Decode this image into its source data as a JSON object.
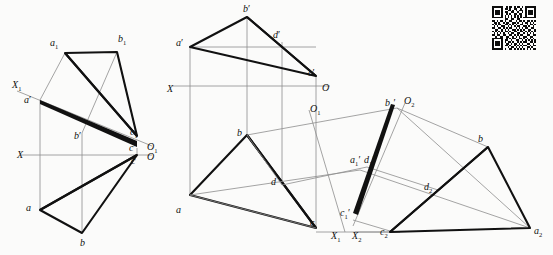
{
  "document": {
    "kind": "descriptive-geometry-projection-drawing",
    "figure_count": 3,
    "background_color": "#fbfbfa",
    "line_color": "#1a1a1a",
    "thin_line_color": "#8d8d8d"
  },
  "figures": [
    {
      "id": "figure-left",
      "name": "left-projection",
      "axes": [
        {
          "name": "x-axis-primary",
          "label": "X",
          "origin_label": "O"
        },
        {
          "name": "x1-axis-auxiliary",
          "label": "X",
          "sub": "1",
          "origin_label": "O",
          "origin_sub": "1"
        }
      ],
      "labels": [
        {
          "name": "vertex-a1",
          "base": "a",
          "sub": "1",
          "prime": "",
          "x": 50,
          "y": 38
        },
        {
          "name": "vertex-b1",
          "base": "b",
          "sub": "1",
          "prime": "",
          "x": 118,
          "y": 34
        },
        {
          "name": "axis-x1",
          "base": "X",
          "sub": "1",
          "prime": "",
          "x": 12,
          "y": 80
        },
        {
          "name": "vertex-a-prime",
          "base": "a",
          "sub": "",
          "prime": "′",
          "x": 24,
          "y": 95
        },
        {
          "name": "vertex-b-prime",
          "base": "b",
          "sub": "",
          "prime": "′",
          "x": 74,
          "y": 131
        },
        {
          "name": "vertex-c1",
          "base": "c",
          "sub": "1",
          "prime": "",
          "x": 130,
          "y": 127
        },
        {
          "name": "vertex-c-prime",
          "base": "c",
          "sub": "",
          "prime": "′",
          "x": 129,
          "y": 143
        },
        {
          "name": "origin-o1",
          "base": "O",
          "sub": "1",
          "prime": "",
          "x": 147,
          "y": 142
        },
        {
          "name": "axis-x",
          "base": "X",
          "sub": "",
          "prime": "",
          "x": 17,
          "y": 150
        },
        {
          "name": "vertex-c",
          "base": "c",
          "sub": "",
          "prime": "",
          "x": 131,
          "y": 156
        },
        {
          "name": "origin-o",
          "base": "O",
          "sub": "",
          "prime": "",
          "x": 147,
          "y": 152
        },
        {
          "name": "vertex-a",
          "base": "a",
          "sub": "",
          "prime": "",
          "x": 26,
          "y": 203
        },
        {
          "name": "vertex-b",
          "base": "b",
          "sub": "",
          "prime": "",
          "x": 80,
          "y": 238
        }
      ]
    },
    {
      "id": "figure-middle",
      "name": "middle-projection",
      "axes": [
        {
          "name": "x-axis-primary",
          "label": "X",
          "origin_label": "O"
        },
        {
          "name": "o1-ray",
          "label": "O",
          "sub": "1"
        }
      ],
      "labels": [
        {
          "name": "vertex-b-prime",
          "base": "b",
          "sub": "",
          "prime": "′",
          "x": 243,
          "y": 4
        },
        {
          "name": "vertex-a-prime",
          "base": "a",
          "sub": "",
          "prime": "′",
          "x": 176,
          "y": 38
        },
        {
          "name": "vertex-d-prime",
          "base": "d",
          "sub": "",
          "prime": "′",
          "x": 273,
          "y": 30
        },
        {
          "name": "vertex-c-prime",
          "base": "c",
          "sub": "",
          "prime": "′",
          "x": 308,
          "y": 68
        },
        {
          "name": "axis-x",
          "base": "X",
          "sub": "",
          "prime": "",
          "x": 167,
          "y": 84
        },
        {
          "name": "origin-o",
          "base": "O",
          "sub": "",
          "prime": "",
          "x": 322,
          "y": 83
        },
        {
          "name": "origin-o1",
          "base": "O",
          "sub": "1",
          "prime": "",
          "x": 310,
          "y": 104
        },
        {
          "name": "vertex-b",
          "base": "b",
          "sub": "",
          "prime": "",
          "x": 237,
          "y": 128
        },
        {
          "name": "vertex-d",
          "base": "d",
          "sub": "",
          "prime": "",
          "x": 271,
          "y": 177
        },
        {
          "name": "vertex-a",
          "base": "a",
          "sub": "",
          "prime": "",
          "x": 176,
          "y": 205
        },
        {
          "name": "vertex-c",
          "base": "c",
          "sub": "",
          "prime": "",
          "x": 310,
          "y": 218
        }
      ]
    },
    {
      "id": "figure-right",
      "name": "right-auxiliary-projection",
      "axes": [
        {
          "name": "x1-axis",
          "label": "X",
          "sub": "1"
        },
        {
          "name": "x2-axis",
          "label": "X",
          "sub": "2"
        },
        {
          "name": "o2-origin",
          "label": "O",
          "sub": "2"
        }
      ],
      "labels": [
        {
          "name": "vertex-b1-prime",
          "base": "b",
          "sub": "1",
          "prime": "′",
          "x": 385,
          "y": 98
        },
        {
          "name": "origin-o2",
          "base": "O",
          "sub": "2",
          "prime": "",
          "x": 404,
          "y": 96
        },
        {
          "name": "vertex-b2",
          "base": "b",
          "sub": "",
          "prime": "",
          "x": 478,
          "y": 134
        },
        {
          "name": "vertex-a1-prime",
          "base": "a",
          "sub": "1",
          "prime": "′",
          "x": 350,
          "y": 155
        },
        {
          "name": "vertex-d1-prime",
          "base": "d",
          "sub": "1",
          "prime": "′",
          "x": 364,
          "y": 155
        },
        {
          "name": "vertex-d2",
          "base": "d",
          "sub": "2",
          "prime": "",
          "x": 424,
          "y": 182
        },
        {
          "name": "vertex-c1-prime",
          "base": "c",
          "sub": "1",
          "prime": "′",
          "x": 340,
          "y": 208
        },
        {
          "name": "axis-x1",
          "base": "X",
          "sub": "1",
          "prime": "",
          "x": 331,
          "y": 231
        },
        {
          "name": "axis-x2",
          "base": "X",
          "sub": "2",
          "prime": "",
          "x": 352,
          "y": 231
        },
        {
          "name": "vertex-c2",
          "base": "c",
          "sub": "2",
          "prime": "",
          "x": 380,
          "y": 227
        },
        {
          "name": "vertex-a2",
          "base": "a",
          "sub": "2",
          "prime": "",
          "x": 534,
          "y": 226
        }
      ]
    }
  ],
  "qr_code": {
    "name": "qr-code",
    "x": 492,
    "y": 6,
    "size": 44,
    "modules": 25,
    "rows": [
      "1111111001011010110101111111",
      "1000001011010011001001000001",
      "1011101000110101011101011101",
      "1011101011001100100101011101",
      "1011101001010011011001011101",
      "1000001010101010101001000001",
      "1111111010101010101011111111",
      "0000000011001100110000000000",
      "1101011010011001011010110101",
      "0110100101100110100101101010",
      "1010110011010101001100101101",
      "0101001100101010110011010010",
      "1100110101011001010101100110",
      "0011001010100110101010011001",
      "1010101011010011001101010101",
      "0101010100101100110010101010",
      "1101100110011010101100110011",
      "0010011001100101010011001100",
      "1111111001010110011010101010",
      "1000001011001001100101010101",
      "1011101010110100101011001101",
      "1011101001101011010100110010",
      "1011101011010010101011001011",
      "1000001000101101010100110100",
      "1111111010011010101010101011"
    ]
  }
}
